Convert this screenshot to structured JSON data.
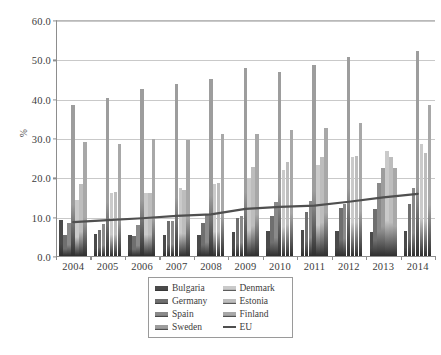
{
  "chart_data": {
    "type": "bar",
    "title": "",
    "subtitle": "",
    "xlabel": "",
    "ylabel": "%",
    "ylim": [
      0,
      60
    ],
    "ytick_step": 10,
    "ytick_labels": [
      "0.0",
      "10.0",
      "20.0",
      "30.0",
      "40.0",
      "50.0",
      "60.0"
    ],
    "ytick_values": [
      0,
      10,
      20,
      30,
      40,
      50,
      60
    ],
    "grid": true,
    "legend_position": "bottom-center",
    "categories": [
      "2004",
      "2005",
      "2006",
      "2007",
      "2008",
      "2009",
      "2010",
      "2011",
      "2012",
      "2013",
      "2014"
    ],
    "series": [
      {
        "name": "Bulgaria",
        "type": "bar",
        "color": "#4a4a4a",
        "values": [
          9.2,
          5.6,
          5.3,
          5.3,
          5.3,
          6.1,
          6.4,
          6.5,
          6.3,
          6.2,
          6.4
        ]
      },
      {
        "name": "Germany",
        "type": "bar",
        "color": "#6f6f6f",
        "values": [
          5.3,
          6.6,
          5.2,
          8.9,
          8.4,
          9.7,
          10.3,
          11.3,
          12.1,
          11.9,
          13.3
        ]
      },
      {
        "name": "Spain",
        "type": "bar",
        "color": "#8a8a8a",
        "values": [
          8.3,
          8.2,
          8.0,
          8.9,
          10.4,
          10.2,
          13.8,
          13.9,
          13.3,
          18.5,
          17.4
        ]
      },
      {
        "name": "Sweden",
        "type": "bar",
        "color": "#9d9d9d",
        "values": [
          38.5,
          40.3,
          42.4,
          43.8,
          45.0,
          47.9,
          46.8,
          48.5,
          50.6,
          22.5,
          52.0
        ]
      },
      {
        "name": "Denmark",
        "type": "bar",
        "color": "#cacaca",
        "values": [
          14.3,
          15.9,
          15.9,
          17.3,
          18.2,
          19.5,
          21.8,
          23.2,
          25.1,
          26.6,
          28.4
        ]
      },
      {
        "name": "Estonia",
        "type": "bar",
        "color": "#bdbdbd",
        "values": [
          18.2,
          16.3,
          16.0,
          16.7,
          18.6,
          22.6,
          24.0,
          25.1,
          25.5,
          25.1,
          26.2
        ]
      },
      {
        "name": "Finland",
        "type": "bar",
        "color": "#a8a8a8",
        "values": [
          28.9,
          28.6,
          29.8,
          29.4,
          31.1,
          31.0,
          32.1,
          32.5,
          33.9,
          22.5,
          38.3
        ]
      },
      {
        "name": "EU",
        "type": "line",
        "color": "#4f4f4f",
        "values": [
          8.6,
          9.1,
          9.6,
          10.2,
          10.6,
          12.0,
          12.5,
          12.8,
          13.8,
          14.9,
          15.8
        ]
      }
    ]
  },
  "legend": {
    "items": [
      {
        "label": "Bulgaria",
        "kind": "swatch"
      },
      {
        "label": "Denmark",
        "kind": "swatch"
      },
      {
        "label": "Germany",
        "kind": "swatch"
      },
      {
        "label": "Estonia",
        "kind": "swatch"
      },
      {
        "label": "Spain",
        "kind": "swatch"
      },
      {
        "label": "Finland",
        "kind": "swatch"
      },
      {
        "label": "Sweden",
        "kind": "swatch"
      },
      {
        "label": "EU",
        "kind": "line"
      }
    ]
  }
}
